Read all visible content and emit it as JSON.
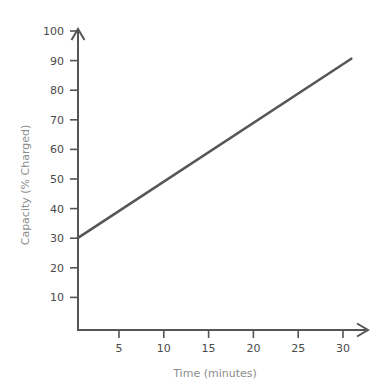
{
  "chart_data": {
    "type": "line",
    "title": "",
    "xlabel": "Time (minutes)",
    "ylabel": "Capacity (% Charged)",
    "xlim": [
      0,
      32
    ],
    "ylim": [
      0,
      103
    ],
    "xticks": [
      5,
      10,
      15,
      20,
      25,
      30
    ],
    "yticks": [
      10,
      20,
      30,
      40,
      50,
      60,
      70,
      80,
      90,
      100
    ],
    "grid": false,
    "legend": null,
    "series": [
      {
        "name": "Battery charge",
        "color": "#575757",
        "x": [
          0,
          30.5
        ],
        "y": [
          30,
          90.5
        ],
        "points": [
          {
            "x": 0,
            "y": 30
          },
          {
            "x": 5,
            "y": 40
          },
          {
            "x": 10,
            "y": 50
          },
          {
            "x": 15,
            "y": 60
          },
          {
            "x": 20,
            "y": 70
          },
          {
            "x": 25,
            "y": 80
          },
          {
            "x": 30,
            "y": 90
          }
        ]
      }
    ],
    "annotations": []
  },
  "axes": {
    "x_title": "Time (minutes)",
    "y_title": "Capacity (% Charged)",
    "x_tick_labels": [
      "5",
      "10",
      "15",
      "20",
      "25",
      "30"
    ],
    "y_tick_labels": [
      "10",
      "20",
      "30",
      "40",
      "50",
      "60",
      "70",
      "80",
      "90",
      "100"
    ]
  },
  "colors": {
    "line": "#575757",
    "axis": "#555555",
    "tick_text": "#4a4a4a",
    "axis_title_text": "#8c8c8c",
    "background": "#ffffff"
  }
}
